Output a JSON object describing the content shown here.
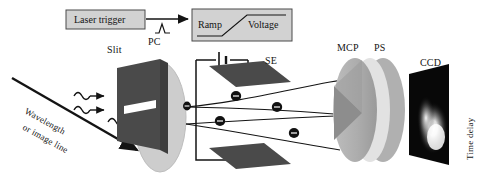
{
  "figure": {
    "colors": {
      "background": "#ffffff",
      "stroke": "#141414",
      "box_fill": "#d2d2d2",
      "plate_dark": "#4f4f4f",
      "disc_light": "#c9c9c9",
      "disc_mid": "#a8a8a8",
      "disc_pale": "#e0e0e0",
      "wedge_dark": "#8a8a8a",
      "ccd_panel": "#080808",
      "glow": "#ffffff",
      "electron": "#111111"
    }
  },
  "trigger_chain": {
    "laser_trigger_label": "Laser trigger",
    "pulse_icon": "pulse-waveform-icon",
    "arrow_icon": "arrow-right-icon",
    "ramp_label": "Ramp",
    "voltage_label": "Voltage",
    "ramp_icon": "ramp-waveform-icon"
  },
  "input_optics": {
    "beam_label_line1": "Wavelength",
    "beam_label_line2": "or image line",
    "beam_arrow_icon": "arrow-diagonal-icon",
    "photon_icon": "squiggly-photon-arrow-icon",
    "photon_count": 3,
    "slit_label": "Slit",
    "slit_aperture_icon": "slit-aperture-icon",
    "pc_label": "PC"
  },
  "deflection": {
    "se_label": "SE",
    "battery_icon": "battery-symbol-icon",
    "plate_icon": "deflection-plate-icon",
    "electron_icon": "electron-minus-icon",
    "electron_count": 5,
    "trajectory_icon": "electron-trajectory-icon"
  },
  "detector": {
    "mcp_label": "MCP",
    "ps_label": "PS",
    "ccd_label": "CCD",
    "time_delay_label": "Time delay",
    "glow_icon": "streak-glow-icon"
  }
}
